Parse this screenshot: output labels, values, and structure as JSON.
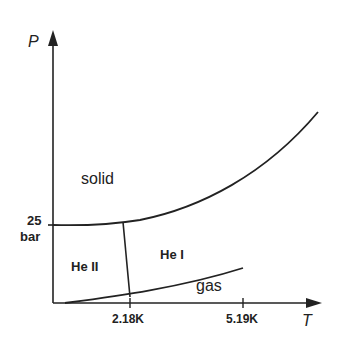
{
  "axes": {
    "y_label": "P",
    "x_label": "T",
    "y_tick": {
      "value": "25",
      "unit": "bar"
    },
    "x_ticks": [
      "2.18K",
      "5.19K"
    ]
  },
  "regions": {
    "solid": "solid",
    "he2": "He II",
    "he1": "He I",
    "gas": "gas"
  },
  "colors": {
    "line": "#222222",
    "background": "#ffffff"
  }
}
